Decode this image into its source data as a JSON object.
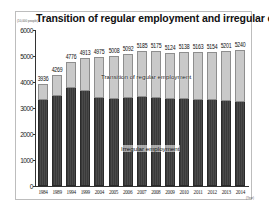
{
  "chart_data": {
    "type": "bar",
    "stacked": true,
    "title": "Transition of regular employment and irregular employment",
    "ylabel": "(10,000 people)",
    "xlabel": "(Year)",
    "ylim": [
      0,
      6000
    ],
    "yticks": [
      0,
      1000,
      2000,
      3000,
      4000,
      5000,
      6000
    ],
    "grid": false,
    "legend_position": "inline labels on bars",
    "categories": [
      "1984",
      "1989",
      "1994",
      "1999",
      "2004",
      "2005",
      "2006",
      "2007",
      "2008",
      "2009",
      "2010",
      "2011",
      "2012",
      "2013",
      "2014"
    ],
    "totals": [
      3936,
      4269,
      4776,
      4913,
      4975,
      5008,
      5092,
      5185,
      5175,
      5124,
      5138,
      5163,
      5154,
      5201,
      5240
    ],
    "series": [
      {
        "name": "Irregular employment",
        "position": "bottom",
        "color": "#3e3e3e",
        "values": [
          3333,
          3488,
          3805,
          3688,
          3410,
          3374,
          3415,
          3449,
          3410,
          3395,
          3374,
          3352,
          3340,
          3294,
          3278
        ]
      },
      {
        "name": "Transition of regular employment",
        "position": "top",
        "color": "#c9c9c9",
        "values": [
          603,
          781,
          971,
          1225,
          1565,
          1634,
          1677,
          1736,
          1765,
          1729,
          1764,
          1811,
          1814,
          1907,
          1962
        ]
      }
    ]
  },
  "labels": {
    "title": "Transition of regular employment and irregular employment",
    "unit": "(10,000 people)",
    "x_unit": "(Year)",
    "series_top_label": "Transition of regular employment",
    "series_bottom_label": "Irregular employment"
  }
}
